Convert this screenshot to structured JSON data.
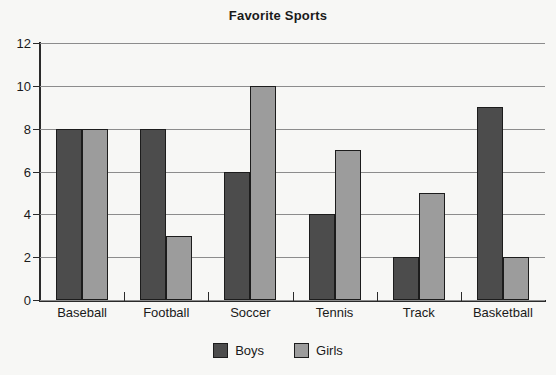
{
  "chart_data": {
    "type": "bar",
    "title": "Favorite Sports",
    "xlabel": "",
    "ylabel": "",
    "ylim": [
      0,
      12
    ],
    "yticks": [
      0,
      2,
      4,
      6,
      8,
      10,
      12
    ],
    "grid": true,
    "legend_position": "bottom",
    "categories": [
      "Baseball",
      "Football",
      "Soccer",
      "Tennis",
      "Track",
      "Basketball"
    ],
    "series": [
      {
        "name": "Boys",
        "color": "#4c4c4c",
        "values": [
          8,
          8,
          6,
          4,
          2,
          9
        ]
      },
      {
        "name": "Girls",
        "color": "#9c9c9c",
        "values": [
          8,
          3,
          10,
          7,
          5,
          2
        ]
      }
    ]
  },
  "figure": {
    "background_color": "#f7f7f5",
    "axis_color": "#2a2a2a",
    "gridline_color": "#8c8c8c"
  }
}
